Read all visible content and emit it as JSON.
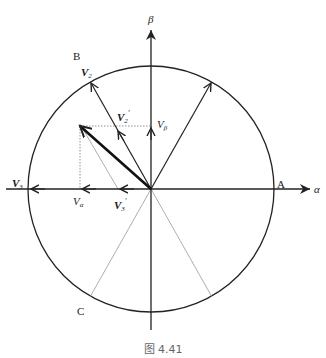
{
  "diagram": {
    "axes": {
      "alpha_label": "α",
      "beta_label": "β"
    },
    "points": {
      "A": "A",
      "B": "B",
      "C": "C"
    },
    "vectors": {
      "V2": "V",
      "V2_sub": "2",
      "V2p": "V",
      "V2p_sub": "2",
      "V2p_prime": "'",
      "V3": "V",
      "V3_sub": "3",
      "V3p": "V",
      "V3p_sub": "3",
      "V3p_prime": "'",
      "Valpha": "V",
      "Valpha_sub": "α",
      "Vbeta": "V",
      "Vbeta_sub": "β"
    },
    "caption": "图 4.41",
    "colors": {
      "line": "#222222",
      "dotted": "#888888"
    }
  }
}
